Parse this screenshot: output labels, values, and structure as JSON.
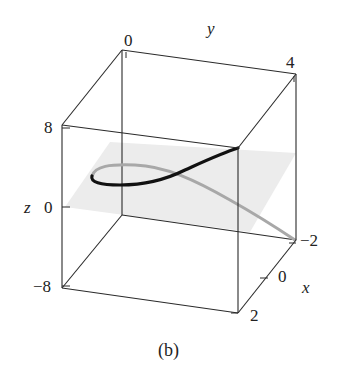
{
  "figure": {
    "caption": "(b)",
    "caption_italic_letter": "b",
    "axes": {
      "x": {
        "label": "x",
        "ticks": [
          "-2",
          "0",
          "2"
        ]
      },
      "y": {
        "label": "y",
        "ticks": [
          "0",
          "4"
        ]
      },
      "z": {
        "label": "z",
        "ticks": [
          "8",
          "0",
          "-8"
        ]
      }
    },
    "elements": {
      "box": "3D bounding box",
      "plane": "gray horizontal plane at z = 0",
      "curve_front": "black curve segment (above plane)",
      "curve_back": "gray curve segment (below/behind plane)"
    },
    "colors": {
      "box_line": "#2a2a2a",
      "plane_fill": "#e9e9e9",
      "curve_black": "#111111",
      "curve_gray": "#a8a8a8"
    }
  }
}
